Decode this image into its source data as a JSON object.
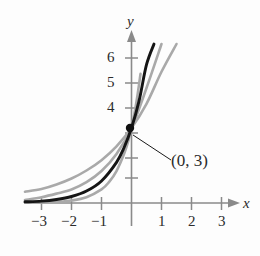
{
  "figure": {
    "kind": "exponential-function-graph",
    "point_label": "(0, 3)",
    "axis_labels": {
      "x": "x",
      "y": "y"
    }
  },
  "chart_data": {
    "type": "line",
    "title": "",
    "xlabel": "x",
    "ylabel": "y",
    "xlim": [
      -3.6,
      3.4
    ],
    "ylim": [
      -0.45,
      7.1
    ],
    "grid": false,
    "legend": null,
    "x_ticks": [
      -3,
      -2,
      -1,
      1,
      2,
      3
    ],
    "x_tick_labels": [
      "−3",
      "−2",
      "−1",
      "1",
      "2",
      "3"
    ],
    "y_ticks": [
      1,
      2,
      3,
      4,
      5,
      6
    ],
    "y_tick_labels": [
      "",
      "",
      "",
      "4",
      "5",
      "6"
    ],
    "annotations": [
      {
        "text": "(0, 3)",
        "x": 0,
        "y": 3,
        "label_x": 1.4,
        "label_y": 1.45
      }
    ],
    "marked_points": [
      {
        "x": 0,
        "y": 3,
        "label": "(0, 3)"
      }
    ],
    "series": [
      {
        "name": "gray-left",
        "color": "#a9a9a9",
        "emphasis": "secondary",
        "y_intercept": 3,
        "base": 5.5,
        "x": [
          -3.55,
          -3,
          -2.5,
          -2,
          -1.5,
          -1,
          -0.75,
          -0.5,
          -0.25,
          -0.1,
          0,
          0.1,
          0.2,
          0.3
        ],
        "values": [
          0.018,
          0.018,
          0.045,
          0.099,
          0.232,
          0.545,
          0.836,
          1.279,
          1.958,
          2.503,
          3.0,
          3.596,
          4.311,
          5.167
        ]
      },
      {
        "name": "black-main",
        "color": "#151515",
        "emphasis": "primary",
        "y_intercept": 3,
        "base": 3.4,
        "x": [
          -3.55,
          -3,
          -2.5,
          -2,
          -1.5,
          -1,
          -0.5,
          -0.25,
          0,
          0.25,
          0.5,
          0.75,
          1.0
        ],
        "values": [
          0.047,
          0.076,
          0.142,
          0.26,
          0.478,
          0.882,
          1.627,
          2.209,
          3.0,
          4.074,
          5.532,
          7.512,
          10.2
        ]
      },
      {
        "name": "gray-mid",
        "color": "#a9a9a9",
        "emphasis": "secondary",
        "y_intercept": 3,
        "base": 2.35,
        "x": [
          -3.55,
          -3,
          -2.5,
          -2,
          -1.5,
          -1,
          -0.5,
          0,
          0.5,
          1.0,
          1.25
        ],
        "values": [
          0.115,
          0.231,
          0.375,
          0.543,
          0.832,
          1.277,
          1.958,
          3.0,
          4.6,
          7.05,
          8.73
        ]
      },
      {
        "name": "gray-right",
        "color": "#a9a9a9",
        "emphasis": "secondary",
        "y_intercept": 3,
        "base": 1.75,
        "x": [
          -3.55,
          -3,
          -2.5,
          -2,
          -1.5,
          -1,
          -0.5,
          0,
          0.5,
          1.0,
          1.5,
          2.0,
          2.2
        ],
        "values": [
          0.45,
          0.56,
          0.74,
          0.98,
          1.3,
          1.714,
          2.268,
          3.0,
          3.968,
          5.25,
          6.94,
          9.19,
          10.3
        ]
      }
    ]
  },
  "labels": {
    "y_axis": "y",
    "x_axis": "x",
    "x_m3": "−3",
    "x_m2": "−2",
    "x_m1": "−1",
    "x_1": "1",
    "x_2": "2",
    "x_3": "3",
    "y_4": "4",
    "y_5": "5",
    "y_6": "6",
    "point": "(0, 3)"
  }
}
